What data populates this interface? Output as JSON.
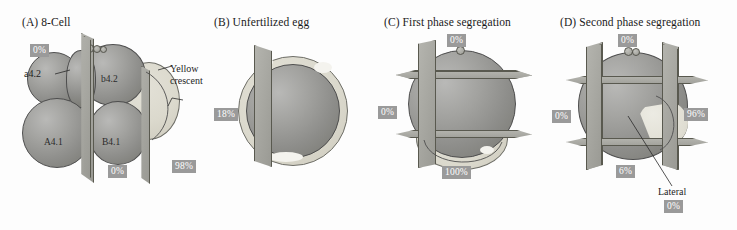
{
  "figure": {
    "panels": [
      {
        "id": "A",
        "title": "(A)  8-Cell",
        "cell_labels": [
          "a4.2",
          "b4.2",
          "A4.1",
          "B4.1"
        ],
        "annotation": "Yellow crescent",
        "annotation_line1": "Yellow",
        "annotation_line2": "crescent",
        "badges": [
          "0%",
          "0%",
          "98%"
        ]
      },
      {
        "id": "B",
        "title": "(B)  Unfertilized egg",
        "badges": [
          "18%"
        ]
      },
      {
        "id": "C",
        "title": "(C)  First phase segregation",
        "badges": [
          "0%",
          "0%",
          "100%"
        ]
      },
      {
        "id": "D",
        "title": "(D)  Second phase segregation",
        "annotation": "Lateral",
        "badges": [
          "0%",
          "0%",
          "96%",
          "6%",
          "0%"
        ]
      }
    ]
  },
  "colors": {
    "badge_bg": "#9a9a9a",
    "badge_text": "#ffffff",
    "cell_fill": "#9a9a96",
    "crescent_fill": "#dedbd0",
    "plane_fill": "#a9a9a3",
    "outline": "#4e4e4e",
    "background": "#fdfdfd"
  }
}
